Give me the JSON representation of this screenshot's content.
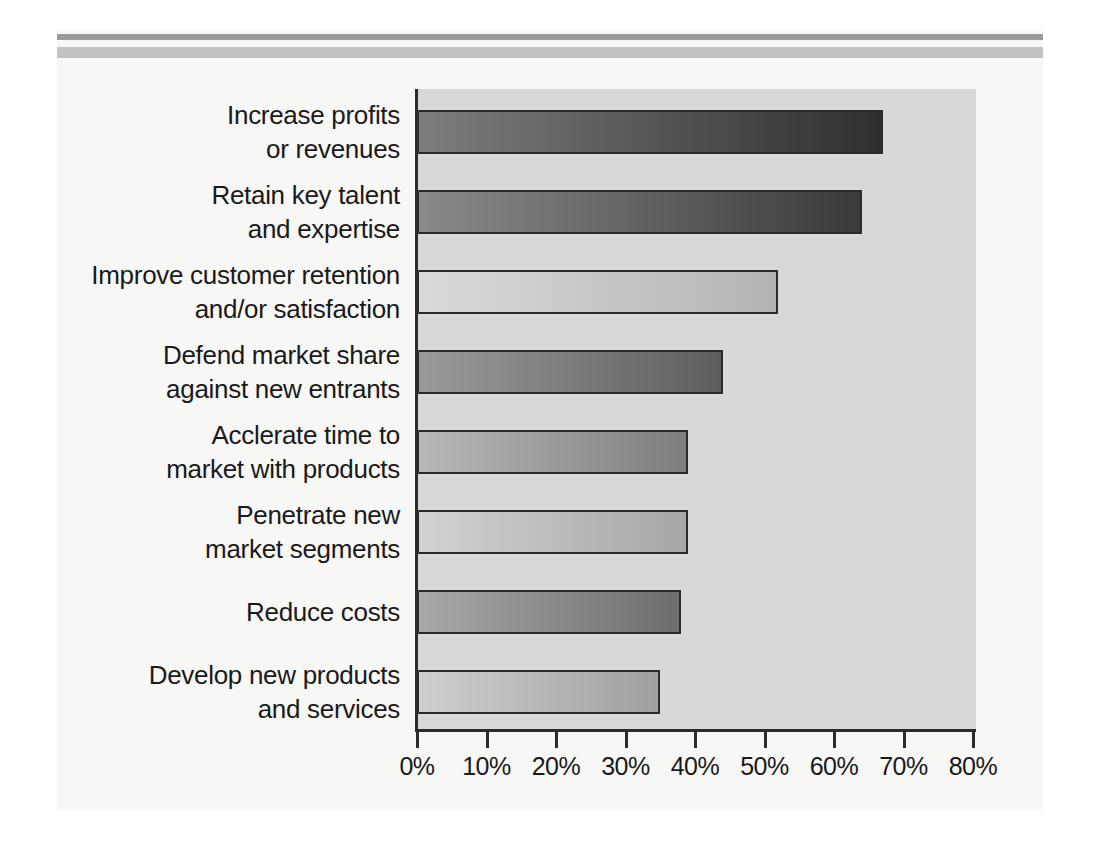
{
  "figure": {
    "background_color": "#f7f7f6",
    "plot_background_color": "#d8d8d8",
    "rule_thin_color": "#9a9a9a",
    "rule_thick_color": "#c2c2c2",
    "axis_color": "#2b2b2b"
  },
  "chart_data": {
    "type": "bar",
    "orientation": "horizontal",
    "title": "",
    "subtitle": "",
    "xlabel": "",
    "ylabel": "",
    "xlim": [
      0,
      80
    ],
    "xtick_values": [
      0,
      10,
      20,
      30,
      40,
      50,
      60,
      70,
      80
    ],
    "xtick_labels": [
      "0%",
      "10%",
      "20%",
      "30%",
      "40%",
      "50%",
      "60%",
      "70%",
      "80%"
    ],
    "grid": false,
    "legend": null,
    "legend_position": "none",
    "categories": [
      "Increase profits or revenues",
      "Retain key talent and expertise",
      "Improve customer retention and/or satisfaction",
      "Defend market share against new entrants",
      "Acclerate time to market with products",
      "Penetrate new market segments",
      "Reduce costs",
      "Develop new products and services"
    ],
    "category_lines": [
      [
        "Increase profits",
        "or revenues"
      ],
      [
        "Retain key talent",
        "and expertise"
      ],
      [
        "Improve customer retention",
        "and/or satisfaction"
      ],
      [
        "Defend market share",
        "against new entrants"
      ],
      [
        "Acclerate time to",
        "market with products"
      ],
      [
        "Penetrate new",
        "market segments"
      ],
      [
        "Reduce costs"
      ],
      [
        "Develop new products",
        "and services"
      ]
    ],
    "values": [
      67,
      64,
      52,
      44,
      39,
      39,
      38,
      35
    ],
    "bar_gradients": [
      [
        "#7d7d7d",
        "#2f2f2f"
      ],
      [
        "#8a8a8a",
        "#3a3a3a"
      ],
      [
        "#dadada",
        "#b4b4b4"
      ],
      [
        "#9a9a9a",
        "#5e5e5e"
      ],
      [
        "#b8b8b8",
        "#7e7e7e"
      ],
      [
        "#d2d2d2",
        "#a6a6a6"
      ],
      [
        "#a8a8a8",
        "#6e6e6e"
      ],
      [
        "#cfcfcf",
        "#a0a0a0"
      ]
    ]
  }
}
